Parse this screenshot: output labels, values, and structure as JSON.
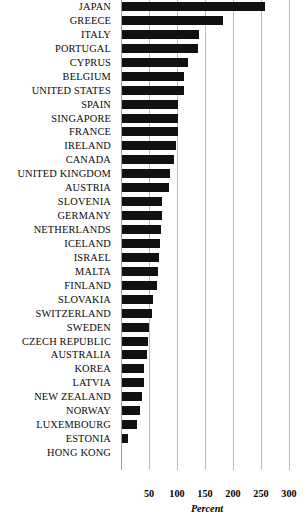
{
  "chart_data": {
    "type": "bar",
    "orientation": "horizontal",
    "title": "",
    "xlabel": "Percent",
    "ylabel": "",
    "xlim": [
      0,
      310
    ],
    "grid": "vertical",
    "legend": "none",
    "xticks": [
      50,
      100,
      150,
      200,
      250,
      300
    ],
    "bar_color": "#111111",
    "gridline_color": "#bcbcbc",
    "categories": [
      "JAPAN",
      "GREECE",
      "ITALY",
      "PORTUGAL",
      "CYPRUS",
      "BELGIUM",
      "UNITED STATES",
      "SPAIN",
      "SINGAPORE",
      "FRANCE",
      "IRELAND",
      "CANADA",
      "UNITED KINGDOM",
      "AUSTRIA",
      "SLOVENIA",
      "GERMANY",
      "NETHERLANDS",
      "ICELAND",
      "ISRAEL",
      "MALTA",
      "FINLAND",
      "SLOVAKIA",
      "SWITZERLAND",
      "SWEDEN",
      "CZECH REPUBLIC",
      "AUSTRALIA",
      "KOREA",
      "LATVIA",
      "NEW ZEALAND",
      "NORWAY",
      "LUXEMBOURG",
      "ESTONIA",
      "HONG KONG"
    ],
    "values": [
      255,
      180,
      137,
      135,
      117,
      110,
      110,
      100,
      100,
      100,
      97,
      93,
      86,
      84,
      72,
      71,
      69,
      68,
      66,
      65,
      63,
      55,
      54,
      49,
      46,
      45,
      40,
      39,
      36,
      33,
      26,
      11,
      0
    ]
  }
}
